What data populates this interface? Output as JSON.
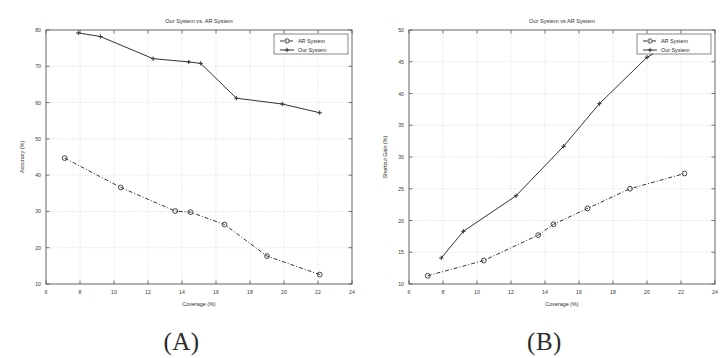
{
  "figure": {
    "panels": [
      {
        "caption": "(A)",
        "name": "panel-a"
      },
      {
        "caption": "(B)",
        "name": "panel-b"
      }
    ]
  },
  "colors": {
    "line": "#333333",
    "axis": "#555555",
    "grid": "#bdbdbd",
    "text": "#2e2e2e",
    "background": "#ffffff"
  },
  "chart_data": [
    {
      "type": "line",
      "title": "Our System vs. AR System",
      "xlabel": "Coverage (%)",
      "ylabel": "Accuracy (%)",
      "xlim": [
        6,
        24
      ],
      "ylim": [
        10,
        80
      ],
      "xticks": [
        6,
        8,
        10,
        12,
        14,
        16,
        18,
        20,
        22,
        24
      ],
      "yticks": [
        10,
        20,
        30,
        40,
        50,
        60,
        70,
        80
      ],
      "grid": true,
      "legend_position": "top-right",
      "series": [
        {
          "name": "AR System",
          "marker": "circle",
          "linestyle": "dashdot",
          "x": [
            7.1,
            10.4,
            13.6,
            14.5,
            16.5,
            19.0,
            22.1
          ],
          "y": [
            44.7,
            36.6,
            30.1,
            29.8,
            26.4,
            17.7,
            12.6
          ]
        },
        {
          "name": "Our System",
          "marker": "cross",
          "linestyle": "solid",
          "x": [
            7.9,
            9.2,
            12.3,
            14.4,
            15.1,
            17.2,
            19.9,
            22.1
          ],
          "y": [
            79.2,
            78.2,
            72.1,
            71.2,
            70.8,
            61.2,
            59.6,
            57.2
          ]
        }
      ]
    },
    {
      "type": "line",
      "title": "Our System vs  AR System",
      "xlabel": "Coverage (%)",
      "ylabel": "Shortcut Gain (%)",
      "xlim": [
        6,
        24
      ],
      "ylim": [
        10,
        50
      ],
      "xticks": [
        6,
        8,
        10,
        12,
        14,
        16,
        18,
        20,
        22,
        24
      ],
      "yticks": [
        10,
        15,
        20,
        25,
        30,
        35,
        40,
        45,
        50
      ],
      "grid": true,
      "legend_position": "top-right",
      "series": [
        {
          "name": "AR System",
          "marker": "circle",
          "linestyle": "dashdot",
          "x": [
            7.1,
            10.4,
            13.6,
            14.5,
            16.5,
            19.0,
            22.2
          ],
          "y": [
            11.3,
            13.7,
            17.7,
            19.4,
            21.9,
            25.0,
            27.4
          ]
        },
        {
          "name": "Our System",
          "marker": "cross",
          "linestyle": "solid",
          "x": [
            7.9,
            9.2,
            12.3,
            15.1,
            17.2,
            20.0,
            21.3
          ],
          "y": [
            14.1,
            18.3,
            23.9,
            31.7,
            38.4,
            45.7,
            47.6
          ]
        }
      ]
    }
  ]
}
